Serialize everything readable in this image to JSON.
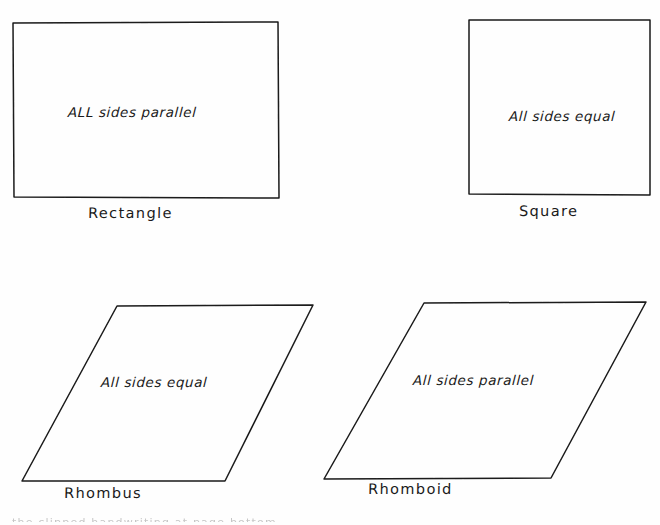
{
  "document": {
    "title": "Quadrilaterals",
    "background_color": "#fefefe",
    "ink_color": "#1a1a1a",
    "width": 660,
    "height": 525
  },
  "shapes": [
    {
      "id": "rectangle",
      "name": "Rectangle",
      "inner_label": "ALL sides parallel",
      "type": "rectangle",
      "points": "13,23 278,22 279,198 14,197",
      "name_pos": {
        "x": 88,
        "y": 205
      },
      "label_pos": {
        "x": 68,
        "y": 104
      }
    },
    {
      "id": "square",
      "name": "Square",
      "inner_label": "All sides equal",
      "type": "square",
      "points": "469,20 650,20 650,195 469,194",
      "name_pos": {
        "x": 519,
        "y": 203
      },
      "label_pos": {
        "x": 509,
        "y": 108
      }
    },
    {
      "id": "rhombus",
      "name": "Rhombus",
      "inner_label": "All sides equal",
      "type": "rhombus",
      "points": "117,306 313,305 225,481 22,481",
      "name_pos": {
        "x": 64,
        "y": 485
      },
      "label_pos": {
        "x": 101,
        "y": 374
      }
    },
    {
      "id": "rhomboid",
      "name": "Rhomboid",
      "inner_label": "All sides parallel",
      "type": "rhomboid",
      "points": "424,303 646,302 551,478 324,479",
      "name_pos": {
        "x": 368,
        "y": 481
      },
      "label_pos": {
        "x": 413,
        "y": 372
      }
    }
  ],
  "footer": {
    "cut_off_text": "the clipped handwriting at page bottom"
  }
}
